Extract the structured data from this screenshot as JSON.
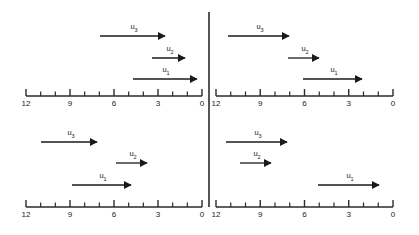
{
  "figure": {
    "type": "number-line-vector-diagram",
    "colors": {
      "background": "#ffffff",
      "ink": "#1a1a1a",
      "axis": "#2b2b2b"
    }
  },
  "geometry": {
    "width": 419,
    "height": 235,
    "divider_x": 209,
    "divider_y_top": 12,
    "divider_y_bottom": 207,
    "axes": {
      "left_x_start": 26,
      "left_x_end": 202,
      "right_x_start": 216,
      "right_x_end": 393,
      "top_axis_y": 96,
      "bottom_axis_y": 207,
      "tick_count": 13,
      "major_tick_len": 7,
      "minor_tick_len": 4.5
    }
  },
  "scale": {
    "max": 12,
    "min": 0,
    "direction": "descending-left-to-right",
    "major_ticks": [
      12,
      9,
      6,
      3,
      0
    ],
    "all_tick_values": [
      12,
      11,
      10,
      9,
      8,
      7,
      6,
      5,
      4,
      3,
      2,
      1,
      0
    ]
  },
  "panels": [
    {
      "id": "top-left",
      "name": "top-left-panel",
      "axis_labels": [
        "12",
        "9",
        "6",
        "3",
        "0"
      ],
      "axis_y": 96,
      "x_start": 26,
      "x_end": 202,
      "vectors": [
        {
          "label": "u",
          "sub": "3",
          "name": "vector-u3",
          "tail": 100,
          "head": 168,
          "y": 36,
          "label_x": 134,
          "label_y": 23
        },
        {
          "label": "u",
          "sub": "2",
          "name": "vector-u2",
          "tail": 152,
          "head": 188,
          "y": 58,
          "label_x": 170,
          "label_y": 45
        },
        {
          "label": "u",
          "sub": "1",
          "name": "vector-u1",
          "tail": 133,
          "head": 200,
          "y": 79,
          "label_x": 166,
          "label_y": 66
        }
      ]
    },
    {
      "id": "top-right",
      "name": "top-right-panel",
      "axis_labels": [
        "12",
        "9",
        "6",
        "3",
        "0"
      ],
      "axis_y": 96,
      "x_start": 216,
      "x_end": 393,
      "vectors": [
        {
          "label": "u",
          "sub": "3",
          "name": "vector-u3",
          "tail": 228,
          "head": 292,
          "y": 36,
          "label_x": 260,
          "label_y": 23
        },
        {
          "label": "u",
          "sub": "2",
          "name": "vector-u2",
          "tail": 288,
          "head": 322,
          "y": 58,
          "label_x": 305,
          "label_y": 45
        },
        {
          "label": "u",
          "sub": "1",
          "name": "vector-u1",
          "tail": 303,
          "head": 365,
          "y": 79,
          "label_x": 334,
          "label_y": 66
        }
      ]
    },
    {
      "id": "bottom-left",
      "name": "bottom-left-panel",
      "axis_labels": [
        "12",
        "9",
        "6",
        "3",
        "0"
      ],
      "axis_y": 207,
      "x_start": 26,
      "x_end": 202,
      "vectors": [
        {
          "label": "u",
          "sub": "3",
          "name": "vector-u3",
          "tail": 41,
          "head": 100,
          "y": 142,
          "label_x": 71,
          "label_y": 129
        },
        {
          "label": "u",
          "sub": "2",
          "name": "vector-u2",
          "tail": 116,
          "head": 150,
          "y": 163,
          "label_x": 133,
          "label_y": 150
        },
        {
          "label": "u",
          "sub": "1",
          "name": "vector-u1",
          "tail": 72,
          "head": 134,
          "y": 185,
          "label_x": 103,
          "label_y": 172
        }
      ]
    },
    {
      "id": "bottom-right",
      "name": "bottom-right-panel",
      "axis_labels": [
        "12",
        "9",
        "6",
        "3",
        "0"
      ],
      "axis_y": 207,
      "x_start": 216,
      "x_end": 393,
      "vectors": [
        {
          "label": "u",
          "sub": "3",
          "name": "vector-u3",
          "tail": 226,
          "head": 290,
          "y": 142,
          "label_x": 258,
          "label_y": 129
        },
        {
          "label": "u",
          "sub": "2",
          "name": "vector-u2",
          "tail": 240,
          "head": 274,
          "y": 163,
          "label_x": 257,
          "label_y": 150
        },
        {
          "label": "u",
          "sub": "1",
          "name": "vector-u1",
          "tail": 318,
          "head": 382,
          "y": 185,
          "label_x": 350,
          "label_y": 172
        }
      ]
    }
  ]
}
